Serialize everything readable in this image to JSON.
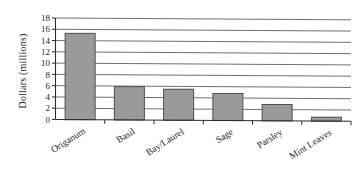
{
  "chart_data": {
    "type": "bar",
    "title": "",
    "subtitle": "",
    "xlabel": "",
    "ylabel": "Dollars (millions)",
    "categories": [
      "Origanum",
      "Basil",
      "Bay/Laurel",
      "Sage",
      "Parsley",
      "Mint Leaves"
    ],
    "values": [
      15.3,
      5.9,
      5.5,
      4.8,
      2.9,
      0.7
    ],
    "series": [
      {
        "name": "Dollars (millions)",
        "values": [
          15.3,
          5.9,
          5.5,
          4.8,
          2.9,
          0.7
        ]
      }
    ],
    "ylim": [
      0,
      18
    ],
    "ytick_step": 2,
    "ytick_labels": [
      "0",
      "2",
      "4",
      "6",
      "8",
      "10",
      "12",
      "14",
      "16",
      "18"
    ],
    "grid": true,
    "grid_axis": "y",
    "legend": false,
    "legend_position": "none",
    "bar_color": "#9a9a9a",
    "bar_border_color": "#4d4d4d",
    "gridline_color": "#4a4a4a",
    "axis_color": "#2b2b2b",
    "background_color": "#ffffff",
    "category_label_rotation": -32
  },
  "axes": {
    "y_axis_title": "Dollars (millions)"
  }
}
